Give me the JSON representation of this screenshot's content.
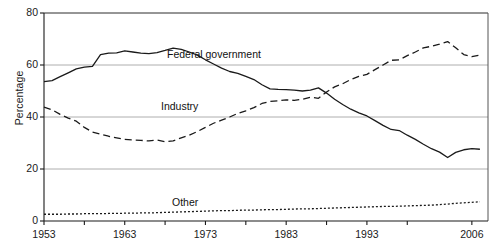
{
  "chart_data": {
    "type": "line",
    "title": "",
    "xlabel": "",
    "ylabel": "Percentage",
    "xlim": [
      1953,
      2008
    ],
    "ylim": [
      0,
      80
    ],
    "yticks": [
      0,
      20,
      40,
      60,
      80
    ],
    "xticks": [
      1953,
      1958,
      1963,
      1968,
      1973,
      1978,
      1983,
      1988,
      1993,
      1998,
      2006
    ],
    "xticklabels": [
      "1953",
      "",
      "1963",
      "",
      "1973",
      "",
      "1983",
      "",
      "1993",
      "",
      "2006"
    ],
    "xticklabels_shown": [
      "1953",
      "1963",
      "1973",
      "1983",
      "1993",
      "2006"
    ],
    "grid": "horizontal",
    "legend_position": "inline-annotations",
    "x": [
      1953,
      1954,
      1955,
      1956,
      1957,
      1958,
      1959,
      1960,
      1961,
      1962,
      1963,
      1964,
      1965,
      1966,
      1967,
      1968,
      1969,
      1970,
      1971,
      1972,
      1973,
      1974,
      1975,
      1976,
      1977,
      1978,
      1979,
      1980,
      1981,
      1982,
      1983,
      1984,
      1985,
      1986,
      1987,
      1988,
      1989,
      1990,
      1991,
      1992,
      1993,
      1994,
      1995,
      1996,
      1997,
      1998,
      1999,
      2000,
      2001,
      2002,
      2003,
      2004,
      2005,
      2006,
      2007
    ],
    "series": [
      {
        "name": "Federal government",
        "style": "solid",
        "color": "#1a1a1a",
        "values": [
          53.6,
          54.0,
          55.5,
          57.0,
          58.5,
          59.2,
          59.5,
          64.0,
          64.6,
          64.7,
          65.4,
          65.0,
          64.6,
          64.4,
          64.8,
          65.6,
          66.5,
          66.0,
          65.0,
          63.8,
          62.0,
          60.4,
          58.8,
          57.5,
          56.8,
          55.6,
          54.4,
          52.4,
          50.8,
          50.6,
          50.5,
          50.3,
          50.0,
          50.3,
          51.2,
          49.2,
          46.8,
          44.8,
          43.0,
          41.6,
          40.4,
          38.6,
          36.8,
          35.2,
          34.8,
          33.0,
          31.4,
          29.5,
          27.8,
          26.5,
          24.4,
          26.4,
          27.4,
          27.8,
          27.6
        ]
      },
      {
        "name": "Industry",
        "style": "dashed",
        "color": "#1a1a1a",
        "values": [
          43.8,
          42.8,
          41.0,
          39.6,
          38.4,
          36.0,
          34.2,
          33.4,
          32.6,
          32.0,
          31.4,
          31.2,
          31.0,
          30.8,
          31.2,
          30.5,
          30.8,
          32.0,
          33.0,
          34.4,
          36.0,
          37.6,
          38.8,
          40.0,
          41.4,
          42.4,
          43.6,
          45.2,
          46.0,
          46.2,
          46.6,
          46.4,
          46.8,
          47.6,
          47.2,
          49.6,
          51.6,
          52.8,
          54.4,
          55.6,
          56.4,
          58.2,
          60.0,
          61.8,
          62.0,
          63.6,
          65.0,
          66.6,
          67.2,
          68.0,
          69.0,
          66.6,
          64.0,
          63.2,
          63.8
        ]
      },
      {
        "name": "Other",
        "style": "dotted",
        "color": "#1a1a1a",
        "values": [
          2.6,
          2.6,
          2.6,
          2.7,
          2.7,
          2.8,
          2.8,
          2.8,
          2.9,
          2.9,
          3.0,
          3.0,
          3.1,
          3.1,
          3.2,
          3.3,
          3.4,
          3.5,
          3.6,
          3.7,
          3.8,
          3.9,
          4.0,
          4.0,
          4.1,
          4.2,
          4.2,
          4.3,
          4.4,
          4.4,
          4.5,
          4.6,
          4.7,
          4.7,
          4.8,
          4.9,
          5.0,
          5.1,
          5.2,
          5.3,
          5.4,
          5.5,
          5.6,
          5.6,
          5.7,
          5.8,
          5.9,
          6.0,
          6.1,
          6.3,
          6.5,
          6.8,
          7.0,
          7.2,
          7.4
        ]
      }
    ],
    "annotations": [
      {
        "text": "Federal government",
        "x_px": 167,
        "y_px": 48
      },
      {
        "text": "Industry",
        "x_px": 161,
        "y_px": 100
      },
      {
        "text": "Other",
        "x_px": 172,
        "y_px": 196
      }
    ]
  }
}
